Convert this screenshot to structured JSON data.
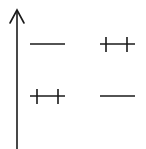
{
  "diagram": {
    "type": "energy-level-diagram",
    "stroke_color": "#1a1a1a",
    "background": "#ffffff",
    "axis": {
      "direction": "up",
      "label": ""
    },
    "columns": [
      {
        "id": "left",
        "levels": [
          {
            "position": "upper",
            "electrons": 0
          },
          {
            "position": "lower",
            "electrons": 2
          }
        ]
      },
      {
        "id": "right",
        "levels": [
          {
            "position": "upper",
            "electrons": 2
          },
          {
            "position": "lower",
            "electrons": 0
          }
        ]
      }
    ]
  }
}
